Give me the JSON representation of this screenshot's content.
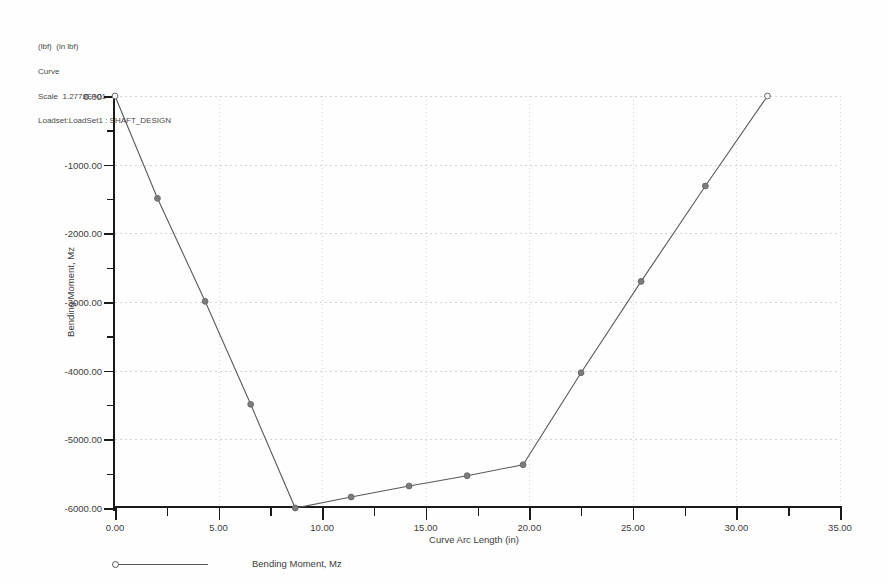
{
  "header": {
    "units_line": "(lbf)  (in lbf)",
    "curve_line": "Curve",
    "scale_line": "Scale  1.2778E+01",
    "loadset_line": "Loadset:LoadSet1 : SHAFT_DESIGN"
  },
  "legend": {
    "series_label": "Bending Moment, Mz",
    "marker_icon": "circle-marker-icon"
  },
  "chart_data": {
    "type": "line",
    "title": "",
    "subtitle": "",
    "xlabel": "Curve Arc Length (in)",
    "ylabel": "Bending Moment, Mz",
    "xlim": [
      0,
      35
    ],
    "ylim": [
      -6000,
      0
    ],
    "xticks": [
      0,
      5,
      10,
      15,
      20,
      25,
      30,
      35
    ],
    "xticklabels": [
      "0.00",
      "5.00",
      "10.00",
      "15.00",
      "20.00",
      "25.00",
      "30.00",
      "35.00"
    ],
    "yticks": [
      0,
      -1000,
      -2000,
      -3000,
      -4000,
      -5000,
      -6000
    ],
    "yticklabels": [
      "0.00",
      "-1000.00",
      "-2000.00",
      "-3000.00",
      "-4000.00",
      "-5000.00",
      "-6000.00"
    ],
    "x_minor_step": 2.5,
    "y_minor_step": 500,
    "grid": true,
    "legend_position": "bottom-left",
    "line_color": "#595959",
    "marker_color": "#6a6a6a",
    "series": [
      {
        "name": "Bending Moment, Mz",
        "x": [
          0.0,
          2.05,
          4.35,
          6.55,
          8.7,
          11.4,
          14.2,
          17.0,
          19.7,
          22.5,
          25.4,
          28.5,
          31.5
        ],
        "y": [
          0,
          -1490,
          -2990,
          -4490,
          -6000,
          -5840,
          -5680,
          -5530,
          -5370,
          -4030,
          -2700,
          -1310,
          0
        ]
      }
    ]
  }
}
